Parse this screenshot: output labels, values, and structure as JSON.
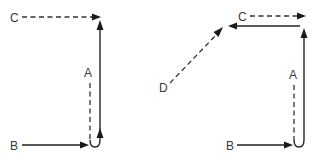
{
  "diagram": {
    "type": "vector-path-diagram",
    "panels": [
      {
        "id": "left",
        "labels": {
          "a": "A",
          "b": "B",
          "c": "C"
        },
        "edges": [
          {
            "from": "B",
            "to": "bottom-corner",
            "style": "solid",
            "direction": "right"
          },
          {
            "from": "bottom-corner",
            "to": "top-corner",
            "style": "solid",
            "direction": "up"
          },
          {
            "from": "A",
            "to": "bottom-corner",
            "style": "dashed",
            "direction": "vertical"
          },
          {
            "from": "C",
            "to": "top-corner",
            "style": "dashed",
            "direction": "right"
          }
        ]
      },
      {
        "id": "right",
        "labels": {
          "a": "A",
          "b": "B",
          "c": "C",
          "d": "D"
        },
        "edges": [
          {
            "from": "B",
            "to": "bottom-corner",
            "style": "solid",
            "direction": "right"
          },
          {
            "from": "bottom-corner",
            "to": "top-corner",
            "style": "solid",
            "direction": "up"
          },
          {
            "from": "top-corner",
            "to": "upper-left",
            "style": "solid",
            "direction": "left"
          },
          {
            "from": "D",
            "to": "upper-left",
            "style": "dashed",
            "direction": "up-right"
          },
          {
            "from": "C",
            "to": "top-corner",
            "style": "dashed",
            "direction": "right"
          },
          {
            "from": "A",
            "to": "bottom-corner",
            "style": "dashed",
            "direction": "vertical"
          }
        ]
      }
    ]
  }
}
